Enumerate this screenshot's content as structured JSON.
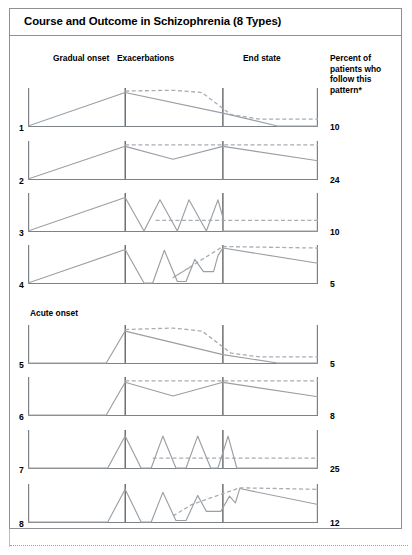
{
  "figure": {
    "title": "Course and Outcome in Schizophrenia (8 Types)",
    "column_headers": {
      "gradual_onset": "Gradual onset",
      "exacerbations": "Exacerbations",
      "end_state": "End state",
      "percent": "Percent of patients who follow this pattern*"
    },
    "group_labels": {
      "gradual": "Gradual onset",
      "acute": "Acute onset"
    },
    "colors": {
      "frame": "#8d9196",
      "solid_line": "#9a9fa4",
      "dashed_line": "#a8adb2",
      "divider": "#4a4d50",
      "axis": "#7d8286",
      "text": "#000000"
    }
  },
  "chart_data": {
    "type": "line",
    "title": "Course and Outcome in Schizophrenia (8 Types)",
    "xlabel": "",
    "ylabel": "",
    "grid": false,
    "legend": "none",
    "x_phase_markers": [
      "Gradual onset",
      "Exacerbations",
      "End state"
    ],
    "x_divider_fractions": [
      0.335,
      0.672
    ],
    "ylim": [
      0,
      1
    ],
    "annotation": "* Percent of patients who follow this pattern",
    "rows": [
      {
        "number": "1",
        "percent": "10",
        "group": "Gradual onset",
        "solid": [
          [
            0.0,
            0.0
          ],
          [
            0.335,
            0.88
          ],
          [
            0.672,
            0.34
          ],
          [
            0.86,
            0.0
          ],
          [
            1.0,
            0.0
          ]
        ],
        "dashed": [
          [
            0.335,
            0.92
          ],
          [
            0.5,
            0.94
          ],
          [
            0.6,
            0.88
          ],
          [
            0.7,
            0.3
          ],
          [
            0.8,
            0.18
          ],
          [
            1.0,
            0.18
          ]
        ]
      },
      {
        "number": "2",
        "percent": "24",
        "group": "Gradual onset",
        "solid": [
          [
            0.0,
            0.0
          ],
          [
            0.335,
            0.86
          ],
          [
            0.5,
            0.52
          ],
          [
            0.672,
            0.86
          ],
          [
            1.0,
            0.48
          ]
        ],
        "dashed": [
          [
            0.335,
            0.9
          ],
          [
            1.0,
            0.9
          ]
        ]
      },
      {
        "number": "3",
        "percent": "10",
        "group": "Gradual onset",
        "solid": [
          [
            0.0,
            0.0
          ],
          [
            0.335,
            0.88
          ],
          [
            0.4,
            0.0
          ],
          [
            0.455,
            0.82
          ],
          [
            0.515,
            0.0
          ],
          [
            0.555,
            0.82
          ],
          [
            0.615,
            0.0
          ],
          [
            0.655,
            0.82
          ],
          [
            0.672,
            0.36
          ],
          [
            0.672,
            0.0
          ],
          [
            1.0,
            0.0
          ]
        ],
        "dashed": [
          [
            0.44,
            0.28
          ],
          [
            1.0,
            0.28
          ]
        ]
      },
      {
        "number": "4",
        "percent": "5",
        "group": "Gradual onset",
        "solid": [
          [
            0.0,
            0.0
          ],
          [
            0.335,
            0.88
          ],
          [
            0.4,
            0.0
          ],
          [
            0.43,
            0.0
          ],
          [
            0.47,
            0.86
          ],
          [
            0.515,
            0.04
          ],
          [
            0.545,
            0.04
          ],
          [
            0.575,
            0.62
          ],
          [
            0.605,
            0.3
          ],
          [
            0.64,
            0.3
          ],
          [
            0.655,
            0.72
          ],
          [
            0.672,
            0.92
          ],
          [
            1.0,
            0.52
          ]
        ],
        "dashed": [
          [
            0.56,
            0.42
          ],
          [
            0.5,
            0.14
          ],
          [
            0.672,
            0.96
          ],
          [
            1.0,
            0.92
          ]
        ]
      },
      {
        "number": "5",
        "percent": "5",
        "group": "Acute onset",
        "solid": [
          [
            0.0,
            0.0
          ],
          [
            0.27,
            0.0
          ],
          [
            0.335,
            0.84
          ],
          [
            0.672,
            0.22
          ],
          [
            0.86,
            0.0
          ],
          [
            1.0,
            0.0
          ]
        ],
        "dashed": [
          [
            0.335,
            0.88
          ],
          [
            0.5,
            0.92
          ],
          [
            0.6,
            0.84
          ],
          [
            0.7,
            0.26
          ],
          [
            0.8,
            0.16
          ],
          [
            1.0,
            0.16
          ]
        ]
      },
      {
        "number": "6",
        "percent": "8",
        "group": "Acute onset",
        "solid": [
          [
            0.0,
            0.0
          ],
          [
            0.27,
            0.0
          ],
          [
            0.335,
            0.86
          ],
          [
            0.5,
            0.5
          ],
          [
            0.672,
            0.86
          ],
          [
            1.0,
            0.48
          ]
        ],
        "dashed": [
          [
            0.335,
            0.9
          ],
          [
            1.0,
            0.9
          ]
        ]
      },
      {
        "number": "7",
        "percent": "25",
        "group": "Acute onset",
        "solid": [
          [
            0.0,
            0.0
          ],
          [
            0.275,
            0.0
          ],
          [
            0.335,
            0.84
          ],
          [
            0.39,
            0.0
          ],
          [
            0.425,
            0.0
          ],
          [
            0.465,
            0.84
          ],
          [
            0.51,
            0.0
          ],
          [
            0.545,
            0.0
          ],
          [
            0.585,
            0.84
          ],
          [
            0.63,
            0.0
          ],
          [
            0.655,
            0.0
          ],
          [
            0.69,
            0.84
          ],
          [
            0.72,
            0.0
          ],
          [
            1.0,
            0.0
          ]
        ],
        "dashed": [
          [
            0.43,
            0.26
          ],
          [
            1.0,
            0.26
          ]
        ]
      },
      {
        "number": "8",
        "percent": "12",
        "group": "Acute onset",
        "solid": [
          [
            0.0,
            0.0
          ],
          [
            0.275,
            0.0
          ],
          [
            0.335,
            0.86
          ],
          [
            0.39,
            0.0
          ],
          [
            0.425,
            0.0
          ],
          [
            0.465,
            0.78
          ],
          [
            0.51,
            0.04
          ],
          [
            0.545,
            0.04
          ],
          [
            0.585,
            0.7
          ],
          [
            0.615,
            0.28
          ],
          [
            0.665,
            0.28
          ],
          [
            0.695,
            0.68
          ],
          [
            0.715,
            0.5
          ],
          [
            0.73,
            0.88
          ],
          [
            1.0,
            0.46
          ]
        ],
        "dashed": [
          [
            0.5,
            0.16
          ],
          [
            0.565,
            0.46
          ],
          [
            0.73,
            0.9
          ],
          [
            1.0,
            0.86
          ]
        ]
      }
    ]
  }
}
